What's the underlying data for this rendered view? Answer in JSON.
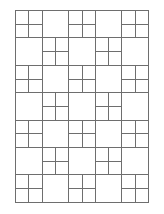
{
  "diagram": {
    "type": "checkerboard-grid",
    "columns": 5,
    "rows": 7,
    "cell_width": 26.6,
    "cell_height": 27.4,
    "subdivide_rule": "(row + col) even",
    "subdivision": 2,
    "line_color": "#6e6e6e",
    "background": "#ffffff",
    "line_width": 1
  }
}
